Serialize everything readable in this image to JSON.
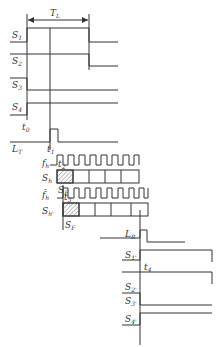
{
  "diagram": {
    "title_label": "T_L",
    "period_label": {
      "main": "T",
      "sub": "L"
    },
    "signals_top": [
      {
        "main": "S",
        "sub": "1"
      },
      {
        "main": "S",
        "sub": "2"
      },
      {
        "main": "S",
        "sub": "3"
      },
      {
        "main": "S",
        "sub": "4"
      }
    ],
    "times": [
      {
        "main": "t",
        "sub": "0"
      },
      {
        "main": "t",
        "sub": "1"
      },
      {
        "main": "t",
        "sub": "2"
      },
      {
        "main": "t",
        "sub": "3"
      },
      {
        "main": "t",
        "sub": "4"
      }
    ],
    "lt_label": {
      "main": "L",
      "sub": "T"
    },
    "fh_label": {
      "main": "f",
      "sub": "h"
    },
    "sh_label": {
      "main": "S",
      "sub": "h"
    },
    "fh_bar_label": {
      "main": "f̄",
      "sub": "h"
    },
    "sh_prime_label": {
      "main": "S",
      "sub": "h'"
    },
    "sf_label": {
      "main": "S",
      "sub": "F"
    },
    "sf2_label": {
      "main": "S",
      "sub": "F"
    },
    "lr_label": {
      "main": "L",
      "sub": "R"
    },
    "signals_bottom": [
      {
        "main": "S",
        "sub": "1'"
      },
      {
        "main": "S",
        "sub": "2'"
      },
      {
        "main": "S",
        "sub": "3'"
      },
      {
        "main": "S",
        "sub": "4'"
      }
    ],
    "colors": {
      "line": "#333333",
      "hatch": "#555555"
    }
  }
}
